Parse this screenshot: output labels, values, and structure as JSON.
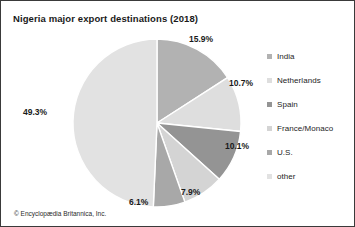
{
  "chart_data": {
    "type": "pie",
    "title": "Nigeria major export destinations (2018)",
    "xlabel": "",
    "ylabel": "",
    "legend_position": "right",
    "grid": false,
    "categories": [
      "India",
      "Netherlands",
      "Spain",
      "France/Monaco",
      "U.S.",
      "other"
    ],
    "values": [
      15.9,
      10.7,
      10.1,
      7.9,
      6.1,
      49.3
    ],
    "value_labels": [
      "15.9%",
      "10.7%",
      "10.1%",
      "7.9%",
      "6.1%",
      "49.3%"
    ],
    "unit": "%",
    "colors": [
      "#b2b2b2",
      "#dedede",
      "#949494",
      "#d4d4d4",
      "#a8a8a8",
      "#e2e2e2"
    ],
    "slice_stroke": "#ffffff",
    "start_angle_deg": 0,
    "direction": "clockwise",
    "slices": [
      {
        "name": "India",
        "value": 15.9,
        "label": "15.9%",
        "color": "#b2b2b2"
      },
      {
        "name": "Netherlands",
        "value": 10.7,
        "label": "10.7%",
        "color": "#dedede"
      },
      {
        "name": "Spain",
        "value": 10.1,
        "label": "10.1%",
        "color": "#949494"
      },
      {
        "name": "France/Monaco",
        "value": 7.9,
        "label": "7.9%",
        "color": "#d4d4d4"
      },
      {
        "name": "U.S.",
        "value": 6.1,
        "label": "6.1%",
        "color": "#a8a8a8"
      },
      {
        "name": "other",
        "value": 49.3,
        "label": "49.3%",
        "color": "#e2e2e2"
      }
    ]
  },
  "title": "Nigeria major export destinations (2018)",
  "legend": {
    "items": [
      {
        "label": "India",
        "color": "#b2b2b2"
      },
      {
        "label": "Netherlands",
        "color": "#dedede"
      },
      {
        "label": "Spain",
        "color": "#949494"
      },
      {
        "label": "France/Monaco",
        "color": "#d4d4d4"
      },
      {
        "label": "U.S.",
        "color": "#a8a8a8"
      },
      {
        "label": "other",
        "color": "#e2e2e2"
      }
    ]
  },
  "labels": {
    "india": "15.9%",
    "netherlands": "10.7%",
    "spain": "10.1%",
    "france_monaco": "7.9%",
    "us": "6.1%",
    "other": "49.3%"
  },
  "credit": "© Encyclopædia Britannica, Inc."
}
